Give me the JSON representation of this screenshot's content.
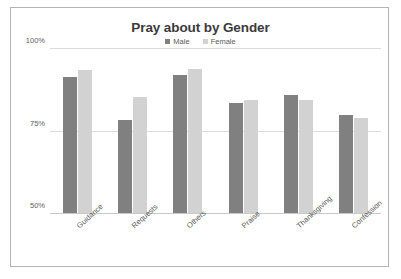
{
  "chart_data": {
    "type": "bar",
    "title": "Pray about by Gender",
    "xlabel": "",
    "ylabel": "",
    "ylim": [
      50,
      100
    ],
    "yticks": [
      "50%",
      "75%",
      "100%"
    ],
    "grid": true,
    "legend_position": "top-center",
    "categories": [
      "Guidance",
      "Requests",
      "Others",
      "Praise",
      "Thanksgiving",
      "Confession"
    ],
    "series": [
      {
        "name": "Male",
        "color": "#808080",
        "values": [
          91.5,
          78.5,
          92,
          83.5,
          86,
          80
        ]
      },
      {
        "name": "Female",
        "color": "#d2d2d2",
        "values": [
          93.5,
          85.5,
          94,
          84.5,
          84.5,
          79
        ]
      }
    ]
  },
  "legend": {
    "items": [
      {
        "label": "Male",
        "marker": "square-marker-male"
      },
      {
        "label": "Female",
        "marker": "square-marker-female"
      }
    ]
  }
}
